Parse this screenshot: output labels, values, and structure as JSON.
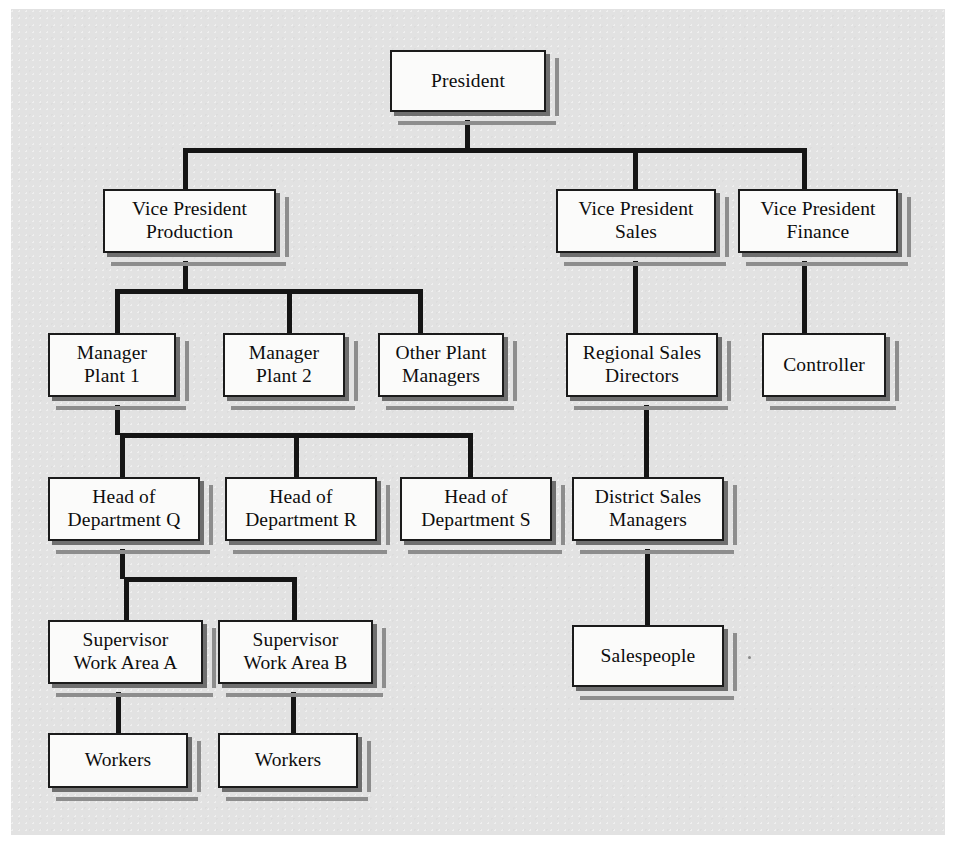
{
  "diagram": {
    "type": "organizational-chart",
    "background_color": "#e2e2e2",
    "box_fill_color": "#fbfbfa",
    "box_border_color": "#1b1b1b",
    "connector_color": "#151515",
    "shadow_color": "#8d8d8d",
    "levels": 6,
    "nodes": [
      {
        "id": "president",
        "label": "President",
        "x": 390,
        "y": 50,
        "w": 156,
        "h": 62,
        "level": 0
      },
      {
        "id": "vp-production",
        "label": "Vice President\nProduction",
        "x": 103,
        "y": 189,
        "w": 173,
        "h": 64,
        "level": 1
      },
      {
        "id": "vp-sales",
        "label": "Vice President\nSales",
        "x": 556,
        "y": 189,
        "w": 160,
        "h": 64,
        "level": 1
      },
      {
        "id": "vp-finance",
        "label": "Vice President\nFinance",
        "x": 738,
        "y": 189,
        "w": 160,
        "h": 64,
        "level": 1
      },
      {
        "id": "manager-plant-1",
        "label": "Manager\nPlant 1",
        "x": 48,
        "y": 333,
        "w": 128,
        "h": 64,
        "level": 2
      },
      {
        "id": "manager-plant-2",
        "label": "Manager\nPlant 2",
        "x": 223,
        "y": 333,
        "w": 122,
        "h": 64,
        "level": 2
      },
      {
        "id": "other-plant-managers",
        "label": "Other Plant\nManagers",
        "x": 378,
        "y": 333,
        "w": 126,
        "h": 64,
        "level": 2
      },
      {
        "id": "regional-sales-directors",
        "label": "Regional Sales\nDirectors",
        "x": 566,
        "y": 333,
        "w": 152,
        "h": 64,
        "level": 2
      },
      {
        "id": "controller",
        "label": "Controller",
        "x": 762,
        "y": 333,
        "w": 124,
        "h": 64,
        "level": 2
      },
      {
        "id": "head-dept-q",
        "label": "Head of\nDepartment Q",
        "x": 48,
        "y": 477,
        "w": 152,
        "h": 64,
        "level": 3
      },
      {
        "id": "head-dept-r",
        "label": "Head of\nDepartment R",
        "x": 225,
        "y": 477,
        "w": 152,
        "h": 64,
        "level": 3
      },
      {
        "id": "head-dept-s",
        "label": "Head of\nDepartment S",
        "x": 400,
        "y": 477,
        "w": 152,
        "h": 64,
        "level": 3
      },
      {
        "id": "district-sales-managers",
        "label": "District Sales\nManagers",
        "x": 572,
        "y": 477,
        "w": 152,
        "h": 64,
        "level": 3
      },
      {
        "id": "supervisor-area-a",
        "label": "Supervisor\nWork Area A",
        "x": 48,
        "y": 620,
        "w": 155,
        "h": 64,
        "level": 4
      },
      {
        "id": "supervisor-area-b",
        "label": "Supervisor\nWork Area B",
        "x": 218,
        "y": 620,
        "w": 155,
        "h": 64,
        "level": 4
      },
      {
        "id": "salespeople",
        "label": "Salespeople",
        "x": 572,
        "y": 625,
        "w": 152,
        "h": 62,
        "level": 4
      },
      {
        "id": "workers-a",
        "label": "Workers",
        "x": 48,
        "y": 733,
        "w": 140,
        "h": 55,
        "level": 5
      },
      {
        "id": "workers-b",
        "label": "Workers",
        "x": 218,
        "y": 733,
        "w": 140,
        "h": 55,
        "level": 5
      }
    ],
    "edges": [
      {
        "from": "president",
        "to": "vp-production"
      },
      {
        "from": "president",
        "to": "vp-sales"
      },
      {
        "from": "president",
        "to": "vp-finance"
      },
      {
        "from": "vp-production",
        "to": "manager-plant-1"
      },
      {
        "from": "vp-production",
        "to": "manager-plant-2"
      },
      {
        "from": "vp-production",
        "to": "other-plant-managers"
      },
      {
        "from": "vp-sales",
        "to": "regional-sales-directors"
      },
      {
        "from": "vp-finance",
        "to": "controller"
      },
      {
        "from": "manager-plant-1",
        "to": "head-dept-q"
      },
      {
        "from": "manager-plant-1",
        "to": "head-dept-r"
      },
      {
        "from": "manager-plant-1",
        "to": "head-dept-s"
      },
      {
        "from": "regional-sales-directors",
        "to": "district-sales-managers"
      },
      {
        "from": "head-dept-q",
        "to": "supervisor-area-a"
      },
      {
        "from": "head-dept-q",
        "to": "supervisor-area-b"
      },
      {
        "from": "district-sales-managers",
        "to": "salespeople"
      },
      {
        "from": "supervisor-area-a",
        "to": "workers-a"
      },
      {
        "from": "supervisor-area-b",
        "to": "workers-b"
      }
    ],
    "connectors": [
      {
        "id": "president-stem",
        "orient": "v",
        "x": 465,
        "y": 120,
        "len": 32
      },
      {
        "id": "president-bus",
        "orient": "h",
        "x": 183,
        "y": 148,
        "len": 624
      },
      {
        "id": "drop-vp-production",
        "orient": "v",
        "x": 183,
        "y": 148,
        "len": 44
      },
      {
        "id": "drop-vp-sales",
        "orient": "v",
        "x": 633,
        "y": 148,
        "len": 44
      },
      {
        "id": "drop-vp-finance",
        "orient": "v",
        "x": 802,
        "y": 148,
        "len": 44
      },
      {
        "id": "vp-production-stem",
        "orient": "v",
        "x": 183,
        "y": 261,
        "len": 30
      },
      {
        "id": "vp-production-bus",
        "orient": "h",
        "x": 115,
        "y": 289,
        "len": 308
      },
      {
        "id": "drop-manager-plant-1",
        "orient": "v",
        "x": 115,
        "y": 289,
        "len": 46
      },
      {
        "id": "drop-manager-plant-2",
        "orient": "v",
        "x": 287,
        "y": 289,
        "len": 46
      },
      {
        "id": "drop-other-plant-mgrs",
        "orient": "v",
        "x": 418,
        "y": 289,
        "len": 46
      },
      {
        "id": "vp-sales-stem",
        "orient": "v",
        "x": 633,
        "y": 261,
        "len": 74
      },
      {
        "id": "vp-finance-stem",
        "orient": "v",
        "x": 802,
        "y": 261,
        "len": 74
      },
      {
        "id": "manager-plant-1-stem",
        "orient": "v",
        "x": 115,
        "y": 405,
        "len": 30
      },
      {
        "id": "manager-plant-1-bus",
        "orient": "h",
        "x": 120,
        "y": 433,
        "len": 352
      },
      {
        "id": "drop-head-dept-q",
        "orient": "v",
        "x": 120,
        "y": 433,
        "len": 46
      },
      {
        "id": "drop-head-dept-r",
        "orient": "v",
        "x": 294,
        "y": 433,
        "len": 46
      },
      {
        "id": "drop-head-dept-s",
        "orient": "v",
        "x": 468,
        "y": 433,
        "len": 46
      },
      {
        "id": "regional-sales-stem",
        "orient": "v",
        "x": 644,
        "y": 405,
        "len": 74
      },
      {
        "id": "head-dept-q-stem",
        "orient": "v",
        "x": 120,
        "y": 549,
        "len": 30
      },
      {
        "id": "head-dept-q-bus",
        "orient": "h",
        "x": 124,
        "y": 577,
        "len": 172
      },
      {
        "id": "drop-supervisor-a",
        "orient": "v",
        "x": 124,
        "y": 577,
        "len": 46
      },
      {
        "id": "drop-supervisor-b",
        "orient": "v",
        "x": 292,
        "y": 577,
        "len": 46
      },
      {
        "id": "district-sales-stem",
        "orient": "v",
        "x": 645,
        "y": 549,
        "len": 78
      },
      {
        "id": "supervisor-a-stem",
        "orient": "v",
        "x": 116,
        "y": 692,
        "len": 43
      },
      {
        "id": "supervisor-b-stem",
        "orient": "v",
        "x": 291,
        "y": 692,
        "len": 43
      }
    ],
    "artifacts": [
      {
        "id": "paper-speck",
        "x": 748,
        "y": 656
      }
    ]
  }
}
